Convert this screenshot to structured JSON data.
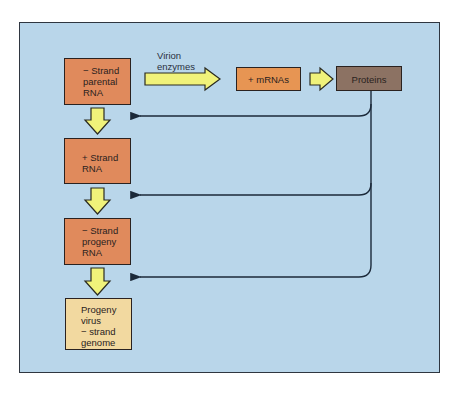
{
  "diagram": {
    "type": "flowchart",
    "title": "",
    "colors": {
      "panel_background": "#b9d6ea",
      "rna_box": "#e08a5c",
      "mrna_box": "#e79553",
      "proteins_box": "#8c7263",
      "genome_box": "#f2d9a0",
      "arrow_fill": "#f0f27a",
      "line": "#1c2a3a"
    },
    "nodes": [
      {
        "id": "neg-strand-parental",
        "lines": [
          "− Strand",
          "parental",
          "RNA"
        ]
      },
      {
        "id": "pos-strand",
        "lines": [
          "+ Strand",
          "RNA"
        ]
      },
      {
        "id": "neg-strand-progeny",
        "lines": [
          "− Strand",
          "progeny",
          "RNA"
        ]
      },
      {
        "id": "progeny-virus",
        "lines": [
          "Progeny",
          "virus",
          "− strand",
          "genome"
        ]
      },
      {
        "id": "mrnas",
        "lines": [
          "+ mRNAs"
        ]
      },
      {
        "id": "proteins",
        "lines": [
          "Proteins"
        ]
      }
    ],
    "edge_label": {
      "lines": [
        "Virion",
        "enzymes"
      ]
    },
    "edges": [
      {
        "from": "neg-strand-parental",
        "to": "mrnas",
        "label": "Virion enzymes",
        "style": "block-arrow"
      },
      {
        "from": "mrnas",
        "to": "proteins",
        "style": "block-arrow"
      },
      {
        "from": "neg-strand-parental",
        "to": "pos-strand",
        "style": "block-arrow"
      },
      {
        "from": "pos-strand",
        "to": "neg-strand-progeny",
        "style": "block-arrow"
      },
      {
        "from": "neg-strand-progeny",
        "to": "progeny-virus",
        "style": "block-arrow"
      },
      {
        "from": "proteins",
        "to": "between parental and + strand",
        "style": "line-arrow"
      },
      {
        "from": "proteins",
        "to": "between + strand and progeny",
        "style": "line-arrow"
      },
      {
        "from": "proteins",
        "to": "between progeny and virus",
        "style": "line-arrow"
      }
    ]
  }
}
